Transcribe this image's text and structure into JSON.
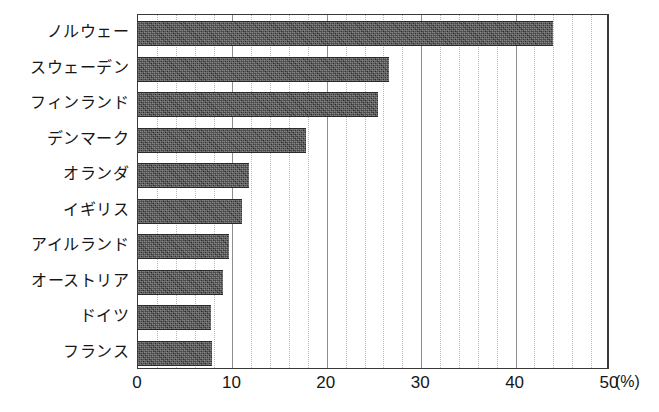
{
  "chart_data": {
    "type": "bar",
    "orientation": "horizontal",
    "title": "",
    "subtitle": "",
    "xlabel": "",
    "ylabel": "",
    "unit_label": "(%)",
    "xlim": [
      0,
      50
    ],
    "xticks": [
      0,
      10,
      20,
      30,
      40,
      50
    ],
    "xtick_labels": [
      "0",
      "10",
      "20",
      "30",
      "40",
      "50"
    ],
    "minor_tick_step": 2,
    "grid": true,
    "legend": "none",
    "categories": [
      "ノルウェー",
      "スウェーデン",
      "フィンランド",
      "デンマーク",
      "オランダ",
      "イギリス",
      "アイルランド",
      "オーストリア",
      "ドイツ",
      "フランス"
    ],
    "values": [
      44.0,
      26.6,
      25.4,
      17.8,
      11.8,
      11.0,
      9.6,
      9.0,
      7.7,
      7.8
    ],
    "bar_color": "#3b3b3b",
    "axis_color": "#3a3a3a",
    "gridline_color": "#b9b9b9"
  }
}
